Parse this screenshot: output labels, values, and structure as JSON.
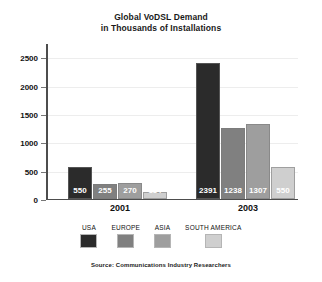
{
  "chart_data": {
    "type": "bar",
    "title": "Global VoDSL Demand in Thousands of Installations",
    "title_line1": "Global VoDSL Demand",
    "title_line2": "in Thousands of Installations",
    "categories": [
      "2001",
      "2003"
    ],
    "series": [
      {
        "name": "USA",
        "values": [
          550,
          2391
        ],
        "color": "#2b2b2b"
      },
      {
        "name": "EUROPE",
        "values": [
          255,
          1238
        ],
        "color": "#808080"
      },
      {
        "name": "ASIA",
        "values": [
          270,
          1307
        ],
        "color": "#9e9e9e"
      },
      {
        "name": "SOUTH AMERICA",
        "values": [
          114,
          550
        ],
        "color": "#cfcfcf"
      }
    ],
    "xlabel": "",
    "ylabel": "",
    "ylim": [
      0,
      2750
    ],
    "yticks": [
      0,
      500,
      1000,
      1500,
      2000,
      2500
    ],
    "ytick_labels": [
      "0",
      "500",
      "1000",
      "1500",
      "2000",
      "2500"
    ],
    "grid": true,
    "legend_position": "bottom",
    "source": "Source: Communications Industry Researchers"
  }
}
